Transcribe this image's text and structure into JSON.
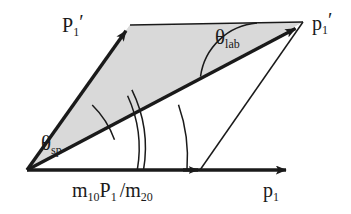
{
  "figure": {
    "type": "vector-diagram",
    "background_color": "#ffffff",
    "stroke_color": "#1a1a1a",
    "shade_color": "#d9d9d9"
  },
  "labels": {
    "p1_prime_cm": {
      "base": "P",
      "sub": "1",
      "prime": "′"
    },
    "p1_prime_lab": {
      "base": "p",
      "sub": "1",
      "prime": "′"
    },
    "theta_lab": {
      "theta": "θ",
      "sub": "lab"
    },
    "theta_sp": {
      "theta": "θ",
      "sub": "sp"
    },
    "m10P1_over_m20": {
      "m1": "m",
      "sub1": "10",
      "P": "P",
      "sub2": "1",
      "slash": "/",
      "m2": "m",
      "sub3": "20"
    },
    "p1": {
      "base": "p",
      "sub": "1"
    }
  },
  "geometry": {
    "origin": {
      "x": 27,
      "y": 170
    },
    "vector_P1_prime_tip": {
      "x": 130,
      "y": 25
    },
    "vector_p1_prime_tip": {
      "x": 303,
      "y": 22
    },
    "axis_tip": {
      "x": 295,
      "y": 170
    },
    "axis_mid_arrow": {
      "x": 200,
      "y": 170
    },
    "top_edge_start": {
      "x": 130,
      "y": 25
    },
    "top_edge_end": {
      "x": 303,
      "y": 22
    },
    "thin_connector_start": {
      "x": 200,
      "y": 170
    },
    "thin_connector_end": {
      "x": 303,
      "y": 22
    },
    "arc_theta_sp_radius": 92,
    "arc_double_radius_outer": 132,
    "arc_double_radius_inner": 126,
    "arc_outer_radius": 160,
    "arc_theta_lab_radius": 62
  }
}
